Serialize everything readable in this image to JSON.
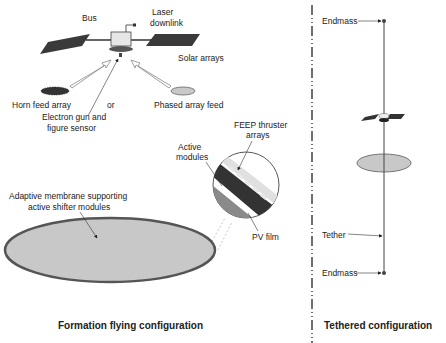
{
  "formation": {
    "title": "Formation flying configuration",
    "labels": {
      "bus": "Bus",
      "laser": [
        "Laser",
        "downlink"
      ],
      "solar_arrays": "Solar arrays",
      "horn_feed": "Horn feed array",
      "or": "or",
      "phased_array": "Phased array feed",
      "electron_gun": [
        "Electron gun and",
        "figure sensor"
      ],
      "feep": [
        "FEEP thruster",
        "arrays"
      ],
      "active_modules": [
        "Active",
        "modules"
      ],
      "pv_film": "PV film",
      "membrane": [
        "Adaptive membrane supporting",
        "active shifter modules"
      ]
    }
  },
  "tethered": {
    "title": "Tethered configuration",
    "labels": {
      "endmass_top": "Endmass",
      "tether": "Tether",
      "endmass_bottom": "Endmass"
    }
  },
  "colors": {
    "membrane_fill": "#c8c8c8",
    "membrane_stroke": "#555555",
    "panel": "#3a3a3a",
    "line": "#333333"
  }
}
